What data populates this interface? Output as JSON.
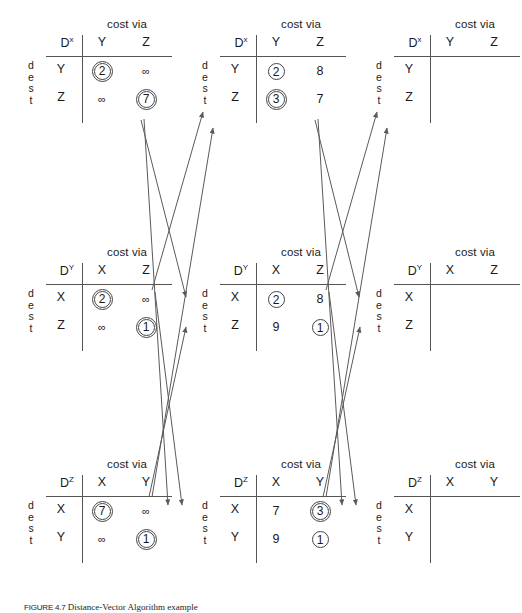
{
  "figure": {
    "caption_label": "FIGURE 4.7",
    "caption_text": "Distance-Vector Algorithm example",
    "cost_via_label": "cost via",
    "dest_label": "dest",
    "infinity": "∞"
  },
  "tables": [
    {
      "id": "dx-t0",
      "node": "D",
      "node_sup": "x",
      "cost_via": "cost via",
      "dest": "dest",
      "columns": [
        "Y",
        "Z"
      ],
      "rows": [
        "Y",
        "Z"
      ],
      "cells": [
        [
          {
            "value": "2",
            "mark": "double-circle"
          },
          {
            "value": "∞",
            "mark": "none"
          }
        ],
        [
          {
            "value": "∞",
            "mark": "none"
          },
          {
            "value": "7",
            "mark": "double-circle"
          }
        ]
      ]
    },
    {
      "id": "dx-t1",
      "node": "D",
      "node_sup": "x",
      "cost_via": "cost via",
      "dest": "dest",
      "columns": [
        "Y",
        "Z"
      ],
      "rows": [
        "Y",
        "Z"
      ],
      "cells": [
        [
          {
            "value": "2",
            "mark": "circle"
          },
          {
            "value": "8",
            "mark": "none"
          }
        ],
        [
          {
            "value": "3",
            "mark": "double-circle"
          },
          {
            "value": "7",
            "mark": "none"
          }
        ]
      ]
    },
    {
      "id": "dx-t2",
      "node": "D",
      "node_sup": "x",
      "cost_via": "cost via",
      "dest": "dest",
      "columns": [
        "Y",
        "Z"
      ],
      "rows": [
        "Y",
        "Z"
      ],
      "cells": [
        [
          {
            "value": "",
            "mark": "none"
          },
          {
            "value": "",
            "mark": "none"
          }
        ],
        [
          {
            "value": "",
            "mark": "none"
          },
          {
            "value": "",
            "mark": "none"
          }
        ]
      ]
    },
    {
      "id": "dy-t0",
      "node": "D",
      "node_sup": "Y",
      "cost_via": "cost via",
      "dest": "dest",
      "columns": [
        "X",
        "Z"
      ],
      "rows": [
        "X",
        "Z"
      ],
      "cells": [
        [
          {
            "value": "2",
            "mark": "double-circle"
          },
          {
            "value": "∞",
            "mark": "none"
          }
        ],
        [
          {
            "value": "∞",
            "mark": "none"
          },
          {
            "value": "1",
            "mark": "double-circle"
          }
        ]
      ]
    },
    {
      "id": "dy-t1",
      "node": "D",
      "node_sup": "Y",
      "cost_via": "cost via",
      "dest": "dest",
      "columns": [
        "X",
        "Z"
      ],
      "rows": [
        "X",
        "Z"
      ],
      "cells": [
        [
          {
            "value": "2",
            "mark": "circle"
          },
          {
            "value": "8",
            "mark": "none"
          }
        ],
        [
          {
            "value": "9",
            "mark": "none"
          },
          {
            "value": "1",
            "mark": "circle"
          }
        ]
      ]
    },
    {
      "id": "dy-t2",
      "node": "D",
      "node_sup": "Y",
      "cost_via": "cost via",
      "dest": "dest",
      "columns": [
        "X",
        "Z"
      ],
      "rows": [
        "X",
        "Z"
      ],
      "cells": [
        [
          {
            "value": "",
            "mark": "none"
          },
          {
            "value": "",
            "mark": "none"
          }
        ],
        [
          {
            "value": "",
            "mark": "none"
          },
          {
            "value": "",
            "mark": "none"
          }
        ]
      ]
    },
    {
      "id": "dz-t0",
      "node": "D",
      "node_sup": "Z",
      "cost_via": "cost via",
      "dest": "dest",
      "columns": [
        "X",
        "Y"
      ],
      "rows": [
        "X",
        "Y"
      ],
      "cells": [
        [
          {
            "value": "7",
            "mark": "double-circle"
          },
          {
            "value": "∞",
            "mark": "none"
          }
        ],
        [
          {
            "value": "∞",
            "mark": "none"
          },
          {
            "value": "1",
            "mark": "double-circle"
          }
        ]
      ]
    },
    {
      "id": "dz-t1",
      "node": "D",
      "node_sup": "Z",
      "cost_via": "cost via",
      "dest": "dest",
      "columns": [
        "X",
        "Y"
      ],
      "rows": [
        "X",
        "Y"
      ],
      "cells": [
        [
          {
            "value": "7",
            "mark": "none"
          },
          {
            "value": "3",
            "mark": "double-circle"
          }
        ],
        [
          {
            "value": "9",
            "mark": "none"
          },
          {
            "value": "1",
            "mark": "circle"
          }
        ]
      ]
    },
    {
      "id": "dz-t2",
      "node": "D",
      "node_sup": "Z",
      "cost_via": "cost via",
      "dest": "dest",
      "columns": [
        "X",
        "Y"
      ],
      "rows": [
        "X",
        "Y"
      ],
      "cells": [
        [
          {
            "value": "",
            "mark": "none"
          },
          {
            "value": "",
            "mark": "none"
          }
        ],
        [
          {
            "value": "",
            "mark": "none"
          },
          {
            "value": "",
            "mark": "none"
          }
        ]
      ]
    }
  ],
  "colors": {
    "line": "#555555",
    "arrow": "#5a5a5a",
    "text": "#1a1a1a",
    "background": "#ffffff"
  }
}
